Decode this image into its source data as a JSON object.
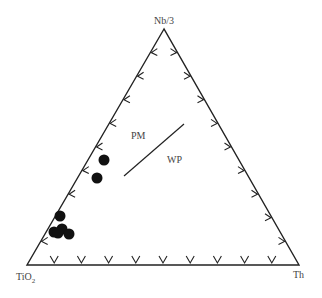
{
  "chart_data": {
    "type": "ternary",
    "vertices": {
      "top": "Nb/3",
      "bottom_left": "TiO2",
      "bottom_right": "Th"
    },
    "fields": [
      {
        "label": "PM"
      },
      {
        "label": "WP"
      }
    ],
    "ticks_per_side": 9,
    "boundary_line": {
      "from": [
        124,
        176
      ],
      "to": [
        184,
        124
      ]
    },
    "points_px": [
      [
        104,
        160
      ],
      [
        97,
        178
      ],
      [
        60,
        216
      ],
      [
        54,
        232
      ],
      [
        62,
        229
      ],
      [
        69,
        234
      ],
      [
        58,
        233
      ]
    ],
    "grid": false
  },
  "labels": {
    "top": "Nb/3",
    "bottom_left_main": "TiO",
    "bottom_left_sub": "2",
    "bottom_right": "Th",
    "field_pm": "PM",
    "field_wp": "WP"
  },
  "colors": {
    "line": "#222222",
    "point": "#111111",
    "text": "#444444"
  }
}
